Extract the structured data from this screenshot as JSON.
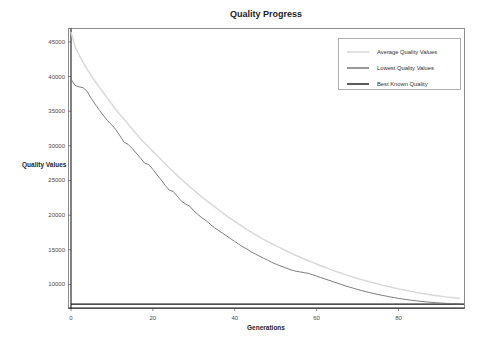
{
  "chart_data": {
    "type": "line",
    "title": "Quality Progress",
    "xlabel": "Generations",
    "ylabel": "Quality Values",
    "xlim": [
      0,
      96
    ],
    "ylim": [
      6600,
      47000
    ],
    "xticks": [
      0,
      20,
      40,
      60,
      80
    ],
    "xtick_labels": [
      "0",
      "20",
      "40",
      "60",
      "80"
    ],
    "yticks": [
      10000,
      15000,
      20000,
      25000,
      30000,
      35000,
      40000,
      45000
    ],
    "ytick_labels": [
      "10000",
      "15000",
      "20000",
      "25000",
      "30000",
      "35000",
      "40000",
      "45000"
    ],
    "grid": false,
    "legend_position": "top-right",
    "legend": [
      {
        "label": "Average Quality Values",
        "color": "#d9d9d9"
      },
      {
        "label": "Lowest Quality Values",
        "color": "#6e6e6e"
      },
      {
        "label": "Best Known Quality",
        "color": "#151515"
      }
    ],
    "x": [
      0,
      1,
      2,
      3,
      4,
      5,
      6,
      7,
      8,
      9,
      10,
      11,
      12,
      13,
      14,
      15,
      16,
      17,
      18,
      19,
      20,
      21,
      22,
      23,
      24,
      25,
      26,
      27,
      28,
      29,
      30,
      31,
      32,
      33,
      34,
      35,
      36,
      37,
      38,
      39,
      40,
      41,
      42,
      43,
      44,
      45,
      46,
      47,
      48,
      49,
      50,
      51,
      52,
      53,
      54,
      55,
      56,
      57,
      58,
      59,
      60,
      61,
      62,
      63,
      64,
      65,
      66,
      67,
      68,
      69,
      70,
      71,
      72,
      73,
      74,
      75,
      76,
      77,
      78,
      79,
      80,
      81,
      82,
      83,
      84,
      85,
      86,
      87,
      88,
      89,
      90,
      91,
      92,
      93,
      94,
      95
    ],
    "series": [
      {
        "name": "Average Quality Values",
        "color": "#d9d9d9",
        "values": [
          46400,
          44300,
          43100,
          42000,
          41000,
          40100,
          39200,
          38400,
          37600,
          36800,
          36000,
          35200,
          34500,
          33800,
          33100,
          32400,
          31700,
          31000,
          30400,
          29800,
          29200,
          28600,
          28000,
          27400,
          26800,
          26250,
          25700,
          25150,
          24600,
          24100,
          23600,
          23100,
          22600,
          22150,
          21700,
          21250,
          20800,
          20350,
          19900,
          19500,
          19100,
          18700,
          18300,
          17900,
          17550,
          17200,
          16850,
          16500,
          16200,
          15900,
          15600,
          15300,
          15000,
          14720,
          14450,
          14180,
          13920,
          13660,
          13420,
          13180,
          12940,
          12700,
          12470,
          12250,
          12030,
          11820,
          11620,
          11420,
          11230,
          11040,
          10860,
          10690,
          10520,
          10360,
          10200,
          10050,
          9900,
          9760,
          9620,
          9490,
          9360,
          9240,
          9120,
          9000,
          8890,
          8780,
          8680,
          8580,
          8490,
          8400,
          8320,
          8240,
          8170,
          8100,
          8040,
          7980
        ]
      },
      {
        "name": "Lowest Quality Values",
        "color": "#6e6e6e",
        "values": [
          39600,
          38700,
          38500,
          38400,
          37800,
          36800,
          35900,
          35100,
          34300,
          33600,
          33000,
          32300,
          31400,
          30500,
          30200,
          29600,
          28900,
          28200,
          27500,
          27300,
          26600,
          25800,
          25100,
          24300,
          23600,
          23400,
          22700,
          22000,
          21600,
          21300,
          20600,
          20100,
          19600,
          19200,
          18700,
          18200,
          17800,
          17400,
          17000,
          16600,
          16200,
          15800,
          15400,
          15100,
          14700,
          14400,
          14100,
          13800,
          13500,
          13200,
          12950,
          12700,
          12500,
          12250,
          12050,
          11900,
          11800,
          11700,
          11600,
          11400,
          11200,
          11000,
          10800,
          10600,
          10400,
          10200,
          10000,
          9800,
          9620,
          9450,
          9280,
          9120,
          8960,
          8820,
          8680,
          8550,
          8430,
          8310,
          8200,
          8090,
          7990,
          7900,
          7810,
          7730,
          7660,
          7590,
          7530,
          7470,
          7420,
          7370,
          7330,
          7290,
          7260,
          7230,
          7210,
          7190
        ]
      },
      {
        "name": "Best Known Quality",
        "color": "#151515",
        "constant": 7150
      }
    ]
  }
}
